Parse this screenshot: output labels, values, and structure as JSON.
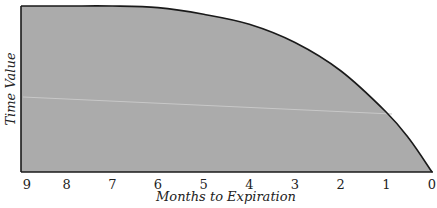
{
  "chart_data": {
    "type": "area",
    "title": "",
    "xlabel": "Months to Expiration",
    "ylabel": "Time Value",
    "x_ticks": [
      "9",
      "8",
      "7",
      "6",
      "5",
      "4",
      "3",
      "2",
      "1",
      "0"
    ],
    "xlim": [
      9,
      0
    ],
    "ylim": [
      0,
      1
    ],
    "y_ticks_shown": false,
    "grid": false,
    "legend": "none",
    "series": [
      {
        "name": "Time Value",
        "x": [
          9,
          8,
          7,
          6,
          5,
          4,
          3,
          2,
          1,
          0.5,
          0
        ],
        "values": [
          1.0,
          1.0,
          1.0,
          0.99,
          0.95,
          0.89,
          0.78,
          0.61,
          0.36,
          0.2,
          0.0
        ]
      }
    ],
    "colors": {
      "fill": "#ababab",
      "line": "#1a1a1a"
    }
  }
}
